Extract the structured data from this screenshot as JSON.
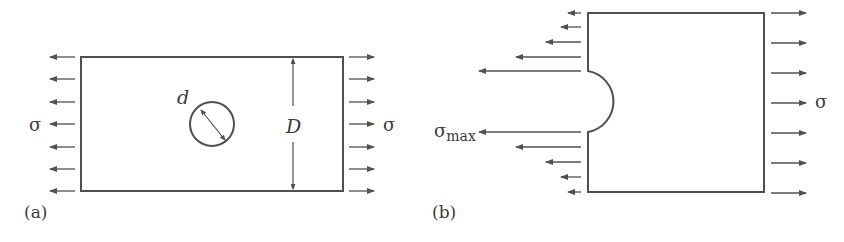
{
  "figure": {
    "panel_a": {
      "label": "(a)",
      "stress_left": "σ",
      "stress_right": "σ",
      "hole_diameter_label": "d",
      "width_label": "D"
    },
    "panel_b": {
      "label": "(b)",
      "stress_max_symbol": "σ",
      "stress_max_subscript": "max",
      "stress_right": "σ"
    }
  },
  "colors": {
    "stroke": "#505050",
    "text": "#3a3a3a",
    "background": "#ffffff"
  }
}
